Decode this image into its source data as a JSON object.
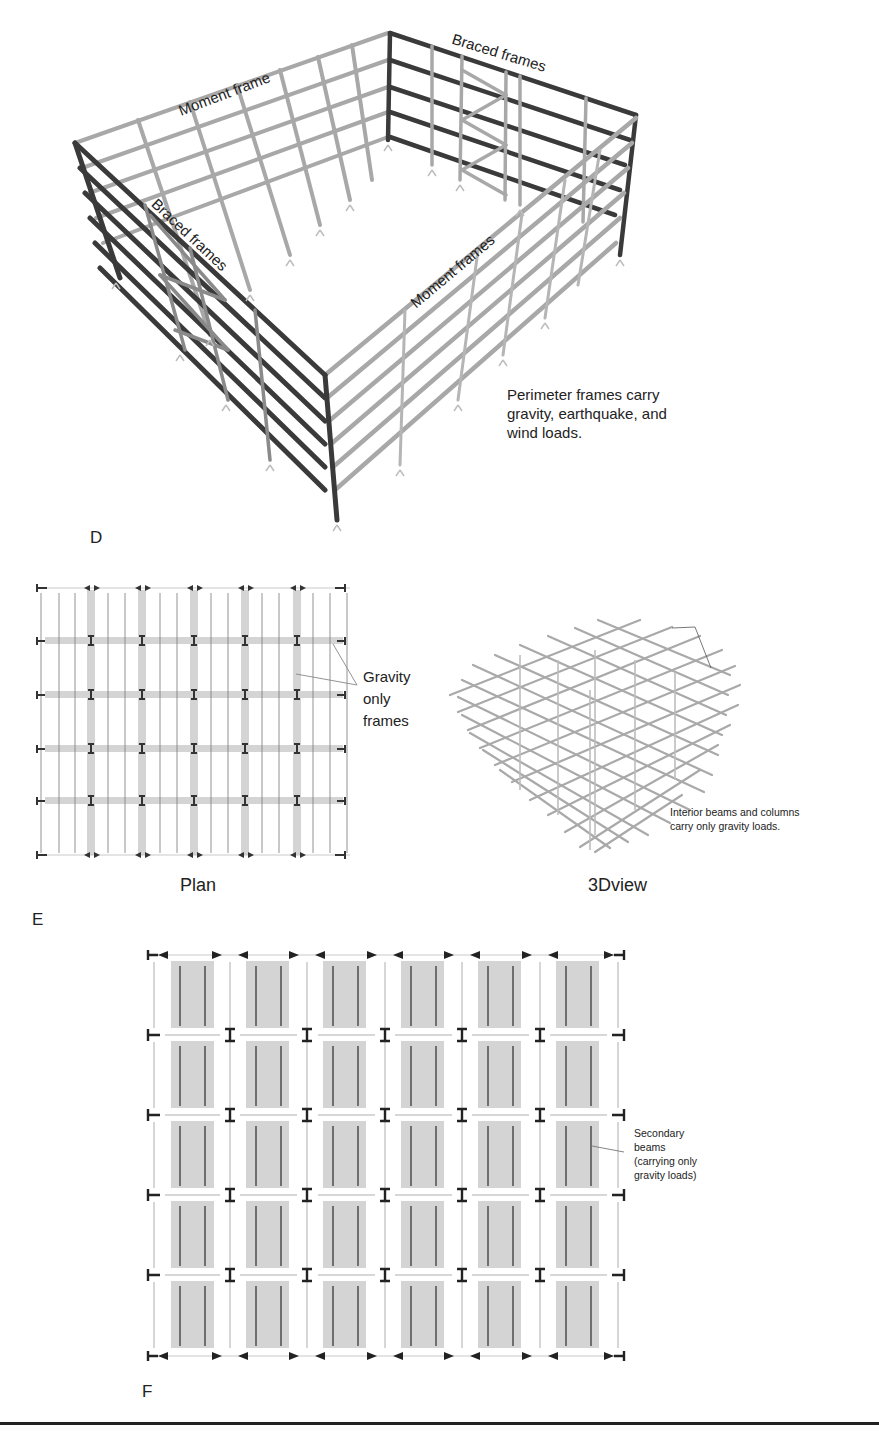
{
  "figure": {
    "panels": [
      {
        "id": "D",
        "letter": "D",
        "kind": "3d-perimeter-frames",
        "labels": {
          "moment_frame_back": "Moment frame",
          "braced_frames_right": "Braced frames",
          "braced_frames_left": "Braced frames",
          "moment_frames_front": "Moment frames"
        },
        "note": [
          "Perimeter frames carry",
          "gravity, earthquake, and",
          "wind loads."
        ]
      },
      {
        "id": "E",
        "letter": "E",
        "kind": "interior-gravity-frames",
        "plan_caption": "Plan",
        "view3d_caption": "3Dview",
        "plan_label": [
          "Gravity",
          "only",
          "frames"
        ],
        "view3d_note": [
          "Interior beams and columns",
          "carry only gravity loads."
        ],
        "plan_grid": {
          "bays_x": 6,
          "bays_y": 5
        }
      },
      {
        "id": "F",
        "letter": "F",
        "kind": "secondary-beams-plan",
        "label": [
          "Secondary",
          "beams",
          "(carrying only",
          "gravity loads)"
        ],
        "grid": {
          "bays_x": 6,
          "bays_y": 5
        }
      }
    ],
    "colors": {
      "dark_member": "#3a3a3a",
      "light_member": "#a8a8a8",
      "mid_member": "#8a8a8a",
      "shade_fill": "#d4d4d4",
      "text": "#222222"
    }
  }
}
